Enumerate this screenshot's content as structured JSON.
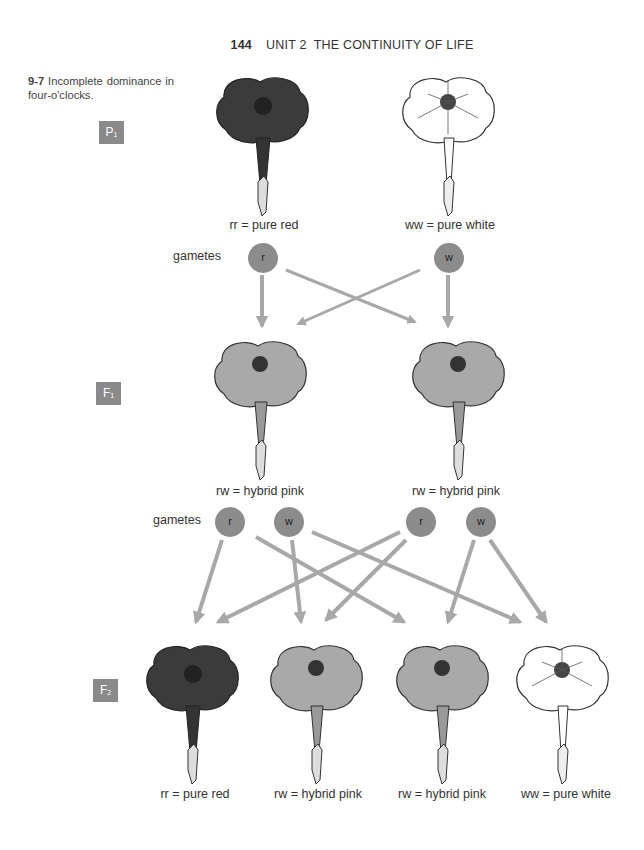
{
  "header": {
    "page_number": "144",
    "title": "UNIT 2  THE CONTINUITY OF LIFE"
  },
  "caption": {
    "figure_number": "9-7",
    "text": "Incomplete dominance in four-o'clocks."
  },
  "generations": {
    "p1": {
      "badge": "P",
      "badge_sub": "1",
      "flowers": [
        {
          "label": "rr = pure red",
          "color": "red",
          "fill": "#3b3b3b"
        },
        {
          "label": "ww = pure white",
          "color": "white",
          "fill": "#ffffff"
        }
      ],
      "gametes_label": "gametes",
      "gametes": [
        "r",
        "w"
      ]
    },
    "f1": {
      "badge": "F",
      "badge_sub": "1",
      "flowers": [
        {
          "label": "rw = hybrid pink",
          "color": "pink",
          "fill": "#a9a9a9"
        },
        {
          "label": "rw = hybrid pink",
          "color": "pink",
          "fill": "#a9a9a9"
        }
      ],
      "gametes_label": "gametes",
      "gametes": [
        "r",
        "w",
        "r",
        "w"
      ]
    },
    "f2": {
      "badge": "F",
      "badge_sub": "2",
      "flowers": [
        {
          "label": "rr = pure red",
          "color": "red",
          "fill": "#3b3b3b"
        },
        {
          "label": "rw = hybrid pink",
          "color": "pink",
          "fill": "#a9a9a9"
        },
        {
          "label": "rw = hybrid pink",
          "color": "pink",
          "fill": "#a9a9a9"
        },
        {
          "label": "ww = pure white",
          "color": "white",
          "fill": "#ffffff"
        }
      ]
    }
  },
  "colors": {
    "badge": "#8a8a8a",
    "gamete": "#8c8c8c",
    "arrow": "#a8a8a8",
    "red_flower": "#3b3b3b",
    "pink_flower": "#a9a9a9"
  }
}
